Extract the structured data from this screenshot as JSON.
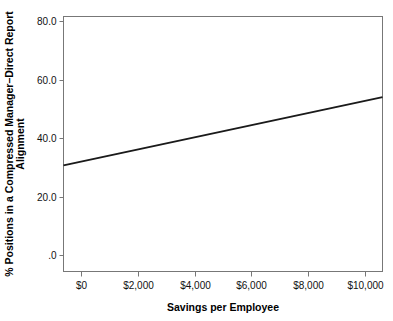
{
  "chart_data": {
    "type": "scatter",
    "title": "",
    "xlabel": "Savings per Employee",
    "ylabel": "% Positions in a Compressed Manager–Direct Report Alignment",
    "ylabel_line1": "% Positions in a Compressed Manager–Direct Report",
    "ylabel_line2": "Alignment",
    "xlim": [
      -600,
      10600
    ],
    "ylim": [
      -5.5,
      81.5
    ],
    "grid": false,
    "legend": null,
    "xtick_labels": [
      "$0",
      "$2,000",
      "$4,000",
      "$6,000",
      "$8,000",
      "$10,000"
    ],
    "xtick_values": [
      0,
      2000,
      4000,
      6000,
      8000,
      10000
    ],
    "ytick_labels": [
      "80.0",
      "60.0",
      "40.0",
      "20.0",
      ".0"
    ],
    "ytick_values": [
      80,
      60,
      40,
      20,
      0
    ],
    "marker_color": "#5a5a5a",
    "line_color": "#1a1a1a",
    "frame_color": "#777777",
    "points": [
      {
        "x": 30,
        "y": 19.0
      },
      {
        "x": 40,
        "y": 7.4
      },
      {
        "x": 360,
        "y": 29.0
      },
      {
        "x": 560,
        "y": 26.0
      },
      {
        "x": 790,
        "y": 73.6
      },
      {
        "x": 980,
        "y": 76.1
      },
      {
        "x": 1000,
        "y": 32.3
      },
      {
        "x": 1400,
        "y": 73.5
      },
      {
        "x": 1370,
        "y": 22.4
      },
      {
        "x": 1450,
        "y": 24.3
      },
      {
        "x": 1460,
        "y": 13.0
      },
      {
        "x": 1950,
        "y": 38.8
      },
      {
        "x": 1980,
        "y": 19.0
      },
      {
        "x": 2640,
        "y": 36.7
      },
      {
        "x": 2700,
        "y": 23.9
      },
      {
        "x": 4780,
        "y": 54.2
      },
      {
        "x": 6470,
        "y": 39.6
      },
      {
        "x": 8400,
        "y": 59.4
      },
      {
        "x": 9320,
        "y": 41.8
      }
    ],
    "trendline": {
      "type": "linear",
      "x_start": -600,
      "y_start": 30.7,
      "x_end": 10600,
      "y_end": 54.0,
      "slope": 0.00208,
      "intercept": 31.95
    }
  }
}
